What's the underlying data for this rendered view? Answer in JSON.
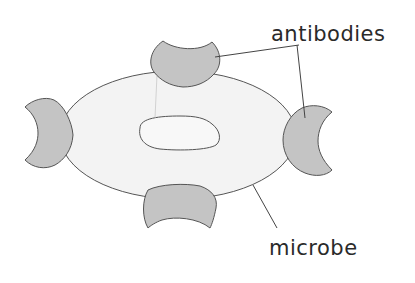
{
  "diagram": {
    "labels": {
      "antibodies": "antibodies",
      "microbe": "microbe"
    },
    "colors": {
      "microbe_fill": "#f3f3f3",
      "antibody_fill": "#c4c4c4",
      "outline": "#555555",
      "text": "#2a2a2a"
    }
  }
}
